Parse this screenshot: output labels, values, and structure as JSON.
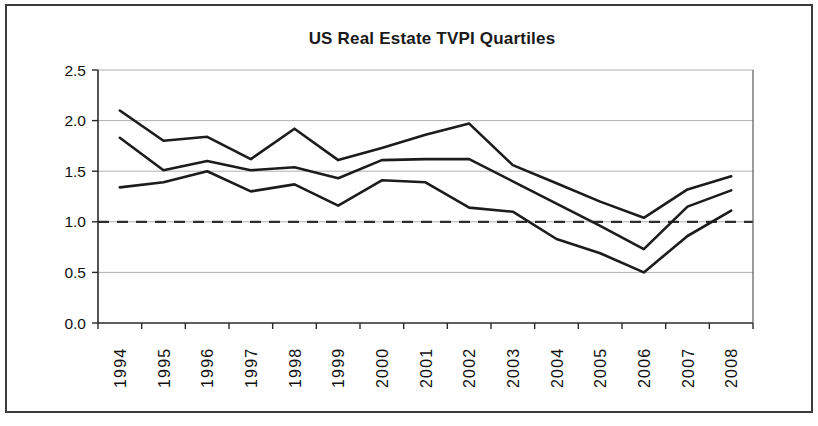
{
  "chart_data": {
    "type": "line",
    "title": "US Real Estate TVPI Quartiles",
    "categories": [
      "1994",
      "1995",
      "1996",
      "1997",
      "1998",
      "1999",
      "2000",
      "2001",
      "2002",
      "2003",
      "2004",
      "2005",
      "2006",
      "2007",
      "2008"
    ],
    "series": [
      {
        "name": "Upper quartile",
        "values": [
          2.1,
          1.8,
          1.84,
          1.62,
          1.92,
          1.61,
          1.73,
          1.86,
          1.97,
          1.56,
          1.38,
          1.2,
          1.04,
          1.32,
          1.45
        ]
      },
      {
        "name": "Median",
        "values": [
          1.83,
          1.51,
          1.6,
          1.51,
          1.54,
          1.43,
          1.61,
          1.62,
          1.62,
          1.4,
          1.18,
          0.96,
          0.73,
          1.15,
          1.31
        ]
      },
      {
        "name": "Lower quartile",
        "values": [
          1.34,
          1.39,
          1.5,
          1.3,
          1.37,
          1.16,
          1.41,
          1.39,
          1.14,
          1.1,
          0.83,
          0.69,
          0.5,
          0.86,
          1.11
        ]
      }
    ],
    "xlabel": "",
    "ylabel": "",
    "ylim": [
      0.0,
      2.5
    ],
    "y_tick_step": 0.5,
    "y_tick_labels": [
      "0.0",
      "0.5",
      "1.0",
      "1.5",
      "2.0",
      "2.5"
    ],
    "reference_line": {
      "value": 1.0,
      "style": "dashed"
    },
    "grid": "horizontal",
    "legend": "none",
    "series_color": "#1c1c1c",
    "gridline_color": "#b0b0b0",
    "axis_color": "#2a2a2a",
    "right_border_color": "#5a5a5a",
    "reference_line_color": "#2e2e2e",
    "tick_label_color": "#111111"
  }
}
